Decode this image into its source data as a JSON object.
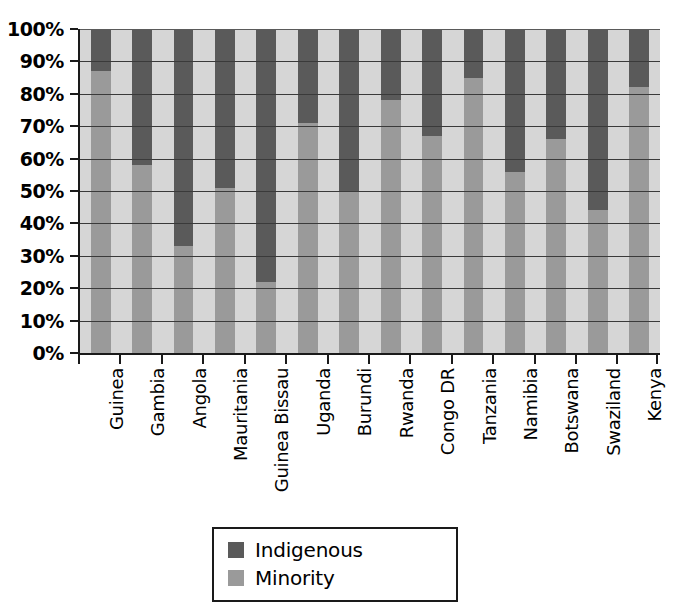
{
  "chart_data": {
    "type": "bar",
    "subtype": "100% stacked bar",
    "title": "",
    "subtitle": "",
    "xlabel": "",
    "ylabel": "",
    "ylim": [
      0,
      100
    ],
    "y_tick_labels": [
      "100%",
      "90%",
      "80%",
      "70%",
      "60%",
      "50%",
      "40%",
      "30%",
      "20%",
      "10%",
      "0%"
    ],
    "y_tick_values": [
      100,
      90,
      80,
      70,
      60,
      50,
      40,
      30,
      20,
      10,
      0
    ],
    "grid": true,
    "grid_axis": "y",
    "legend_position": "bottom-center",
    "categories": [
      "Guinea",
      "Gambia",
      "Angola",
      "Mauritania",
      "Guinea Bissau",
      "Uganda",
      "Burundi",
      "Rwanda",
      "Congo DR",
      "Tanzania",
      "Namibia",
      "Botswana",
      "Swaziland",
      "Kenya"
    ],
    "series": [
      {
        "name": "Minority",
        "color": "#9a9a9a",
        "values": [
          87,
          58,
          33,
          51,
          22,
          71,
          50,
          78,
          67,
          85,
          56,
          66,
          44,
          82
        ]
      },
      {
        "name": "Indigenous",
        "color": "#5a5a5a",
        "values": [
          13,
          42,
          67,
          49,
          78,
          29,
          50,
          22,
          33,
          15,
          44,
          34,
          56,
          18
        ]
      }
    ],
    "stack_order_bottom_to_top": [
      "Minority",
      "Indigenous"
    ],
    "plot_background_color": "#d6d6d6",
    "axis_color": "#1a1a1a"
  },
  "legend": {
    "items": [
      {
        "label": "Indigenous",
        "color": "#5a5a5a",
        "swatch": "indigenous"
      },
      {
        "label": "Minority",
        "color": "#9a9a9a",
        "swatch": "minority"
      }
    ]
  }
}
